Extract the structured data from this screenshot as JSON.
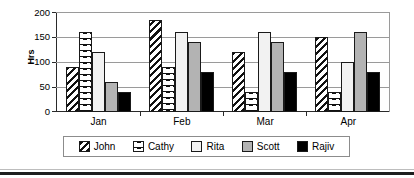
{
  "chart_data": {
    "type": "bar",
    "title": "",
    "xlabel": "",
    "ylabel": "Hrs",
    "categories": [
      "Jan",
      "Feb",
      "Mar",
      "Apr"
    ],
    "ylim": [
      0,
      200
    ],
    "yticks": [
      0,
      50,
      100,
      150,
      200
    ],
    "grid": true,
    "legend_position": "bottom",
    "series": [
      {
        "name": "John",
        "pattern": "diagonal-hatch",
        "color": "#ffffff",
        "values": [
          90,
          185,
          120,
          150
        ]
      },
      {
        "name": "Cathy",
        "pattern": "dashed-lines",
        "color": "#ffffff",
        "values": [
          160,
          90,
          40,
          40
        ]
      },
      {
        "name": "Rita",
        "pattern": "solid",
        "color": "#f2f2f2",
        "values": [
          120,
          160,
          160,
          100
        ]
      },
      {
        "name": "Scott",
        "pattern": "solid",
        "color": "#b3b3b3",
        "values": [
          60,
          140,
          140,
          160
        ]
      },
      {
        "name": "Rajiv",
        "pattern": "solid",
        "color": "#000000",
        "values": [
          40,
          80,
          80,
          80
        ]
      }
    ]
  },
  "axis": {
    "ylabel": "Hrs",
    "yticks": [
      "200",
      "150",
      "100",
      "50",
      "0"
    ],
    "xticks": [
      "Jan",
      "Feb",
      "Mar",
      "Apr"
    ]
  },
  "legend": {
    "entries": [
      {
        "label": "John"
      },
      {
        "label": "Cathy"
      },
      {
        "label": "Rita"
      },
      {
        "label": "Scott"
      },
      {
        "label": "Rajiv"
      }
    ]
  }
}
